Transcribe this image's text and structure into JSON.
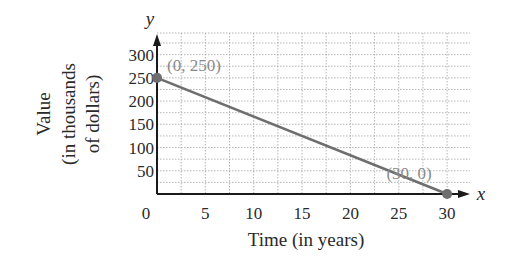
{
  "chart_data": {
    "type": "line",
    "title": "",
    "xlabel": "Time (in years)",
    "ylabel_lines": [
      "Value",
      "(in thousands",
      "of dollars)"
    ],
    "ylabel": "Value (in thousands of dollars)",
    "x_axis_name": "x",
    "y_axis_name": "y",
    "xlim": [
      0,
      30
    ],
    "ylim": [
      0,
      300
    ],
    "x_ticks": [
      0,
      5,
      10,
      15,
      20,
      25,
      30
    ],
    "y_ticks": [
      50,
      100,
      150,
      200,
      250,
      300
    ],
    "grid": true,
    "grid_style": "dotted",
    "series": [
      {
        "name": "Value",
        "color": "#6e6e6e",
        "points": [
          {
            "x": 0,
            "y": 250,
            "label": "(0, 250)"
          },
          {
            "x": 30,
            "y": 0,
            "label": "(30, 0)"
          }
        ]
      }
    ],
    "annotations": [
      "(0, 250)",
      "(30, 0)"
    ],
    "legend": null
  },
  "colors": {
    "axis": "#1a1a1a",
    "grid": "#b5b5b5",
    "line": "#6e6e6e",
    "point": "#6e6e6e",
    "point_label": "#8a8a8a",
    "text": "#2a2a2a"
  }
}
